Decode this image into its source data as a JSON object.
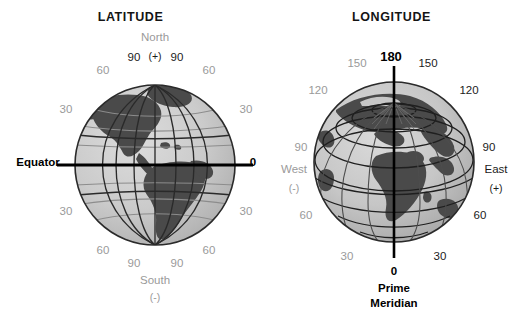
{
  "figure": {
    "kind": "two-globe-diagram",
    "background": "#ffffff",
    "ink_dark": "#1b1b1b",
    "ink_gray": "#9a9a9a",
    "ocean_color": "#c9c9c9",
    "land_color": "#4a4a4a"
  },
  "panels": {
    "latitude": {
      "title": "LATITUDE",
      "pole_label": "North",
      "pole_sign": "(+)",
      "south_label": "South",
      "south_sign": "(-)",
      "equator_label": "Equator",
      "equator_value": "0",
      "ticks_north": [
        "90",
        "90",
        "60",
        "60",
        "30",
        "30"
      ],
      "ticks_south": [
        "30",
        "30",
        "60",
        "60",
        "90",
        "90"
      ],
      "labels": [
        {
          "text": "North",
          "x": 155,
          "y": 38,
          "tone": "gray",
          "size": "n"
        },
        {
          "text": "(+)",
          "x": 155,
          "y": 56,
          "tone": "dark",
          "size": "s"
        },
        {
          "text": "90",
          "x": 134,
          "y": 58,
          "tone": "dark",
          "size": "n"
        },
        {
          "text": "90",
          "x": 177,
          "y": 58,
          "tone": "dark",
          "size": "n"
        },
        {
          "text": "60",
          "x": 103,
          "y": 71,
          "tone": "gray",
          "size": "n"
        },
        {
          "text": "60",
          "x": 209,
          "y": 71,
          "tone": "gray",
          "size": "n"
        },
        {
          "text": "30",
          "x": 66,
          "y": 110,
          "tone": "gray",
          "size": "n"
        },
        {
          "text": "30",
          "x": 246,
          "y": 110,
          "tone": "gray",
          "size": "n"
        },
        {
          "text": "Equator",
          "x": 38,
          "y": 163,
          "tone": "bold",
          "size": "n"
        },
        {
          "text": "0",
          "x": 253,
          "y": 163,
          "tone": "bold",
          "size": "n"
        },
        {
          "text": "30",
          "x": 66,
          "y": 212,
          "tone": "gray",
          "size": "n"
        },
        {
          "text": "30",
          "x": 246,
          "y": 212,
          "tone": "gray",
          "size": "n"
        },
        {
          "text": "60",
          "x": 103,
          "y": 251,
          "tone": "gray",
          "size": "n"
        },
        {
          "text": "60",
          "x": 209,
          "y": 251,
          "tone": "gray",
          "size": "n"
        },
        {
          "text": "90",
          "x": 134,
          "y": 264,
          "tone": "gray",
          "size": "n"
        },
        {
          "text": "90",
          "x": 177,
          "y": 264,
          "tone": "gray",
          "size": "n"
        },
        {
          "text": "South",
          "x": 155,
          "y": 281,
          "tone": "gray",
          "size": "n"
        },
        {
          "text": "(-)",
          "x": 155,
          "y": 297,
          "tone": "gray",
          "size": "s"
        }
      ]
    },
    "longitude": {
      "title": "LONGITUDE",
      "top_label": "180",
      "bottom_value": "0",
      "bottom_label_line1": "Prime",
      "bottom_label_line2": "Meridian",
      "west_label": "West",
      "west_sign": "(-)",
      "east_label": "East",
      "east_sign": "(+)",
      "ticks_west": [
        "150",
        "120",
        "90",
        "60",
        "30"
      ],
      "ticks_east": [
        "150",
        "120",
        "90",
        "60",
        "30"
      ],
      "labels": [
        {
          "text": "180",
          "x": 391,
          "y": 56,
          "tone": "bold",
          "size": "b"
        },
        {
          "text": "150",
          "x": 357,
          "y": 64,
          "tone": "gray",
          "size": "n"
        },
        {
          "text": "150",
          "x": 428,
          "y": 64,
          "tone": "dark",
          "size": "n"
        },
        {
          "text": "120",
          "x": 318,
          "y": 91,
          "tone": "gray",
          "size": "n"
        },
        {
          "text": "120",
          "x": 469,
          "y": 91,
          "tone": "dark",
          "size": "n"
        },
        {
          "text": "90",
          "x": 301,
          "y": 148,
          "tone": "gray",
          "size": "n"
        },
        {
          "text": "90",
          "x": 489,
          "y": 148,
          "tone": "dark",
          "size": "n"
        },
        {
          "text": "West",
          "x": 294,
          "y": 170,
          "tone": "gray",
          "size": "n"
        },
        {
          "text": "East",
          "x": 496,
          "y": 170,
          "tone": "dark",
          "size": "n"
        },
        {
          "text": "(-)",
          "x": 294,
          "y": 188,
          "tone": "gray",
          "size": "s"
        },
        {
          "text": "(+)",
          "x": 496,
          "y": 188,
          "tone": "dark",
          "size": "s"
        },
        {
          "text": "60",
          "x": 306,
          "y": 216,
          "tone": "gray",
          "size": "n"
        },
        {
          "text": "60",
          "x": 480,
          "y": 216,
          "tone": "dark",
          "size": "n"
        },
        {
          "text": "30",
          "x": 347,
          "y": 257,
          "tone": "gray",
          "size": "n"
        },
        {
          "text": "30",
          "x": 440,
          "y": 257,
          "tone": "dark",
          "size": "n"
        },
        {
          "text": "0",
          "x": 394,
          "y": 272,
          "tone": "bold",
          "size": "n"
        },
        {
          "text": "Prime",
          "x": 394,
          "y": 289,
          "tone": "bold",
          "size": "n"
        },
        {
          "text": "Meridian",
          "x": 394,
          "y": 304,
          "tone": "bold",
          "size": "n"
        }
      ]
    }
  }
}
